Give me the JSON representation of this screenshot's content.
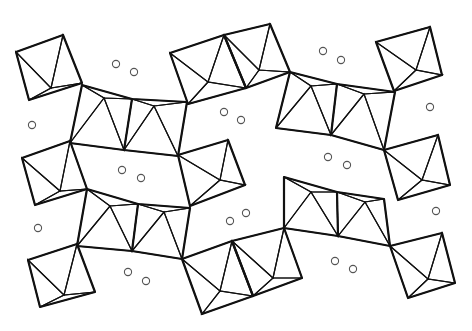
{
  "diagram": {
    "type": "crystal-structure-polyhedral",
    "colors": {
      "background": "#ffffff",
      "outline": "#111111",
      "hatch": "#222222",
      "atom_stroke": "#555555",
      "atom_fill": "#ffffff"
    },
    "hatch_spacing": 3.2,
    "isolated_octahedra": [
      {
        "id": "oct-tl",
        "quad": [
          [
            16,
            52
          ],
          [
            63,
            35
          ],
          [
            82,
            83
          ],
          [
            29,
            100
          ]
        ],
        "apex": [
          51,
          88
        ]
      },
      {
        "id": "oct-tc",
        "quad": [
          [
            170,
            53
          ],
          [
            224,
            35
          ],
          [
            246,
            88
          ],
          [
            188,
            104
          ]
        ],
        "apex": [
          208,
          82
        ]
      },
      {
        "id": "oct-tc2",
        "quad": [
          [
            224,
            35
          ],
          [
            270,
            24
          ],
          [
            290,
            72
          ],
          [
            246,
            88
          ]
        ],
        "apex": [
          259,
          70
        ]
      },
      {
        "id": "oct-tr",
        "quad": [
          [
            376,
            42
          ],
          [
            430,
            27
          ],
          [
            442,
            75
          ],
          [
            394,
            91
          ]
        ],
        "apex": [
          416,
          70
        ]
      },
      {
        "id": "oct-ml",
        "quad": [
          [
            22,
            158
          ],
          [
            70,
            141
          ],
          [
            87,
            189
          ],
          [
            35,
            205
          ]
        ],
        "apex": [
          60,
          191
        ]
      },
      {
        "id": "oct-mc",
        "quad": [
          [
            178,
            155
          ],
          [
            228,
            140
          ],
          [
            245,
            185
          ],
          [
            190,
            206
          ]
        ],
        "apex": [
          220,
          180
        ]
      },
      {
        "id": "oct-mr",
        "quad": [
          [
            384,
            150
          ],
          [
            438,
            135
          ],
          [
            450,
            185
          ],
          [
            398,
            200
          ]
        ],
        "apex": [
          422,
          180
        ]
      },
      {
        "id": "oct-bl",
        "quad": [
          [
            28,
            260
          ],
          [
            77,
            244
          ],
          [
            95,
            292
          ],
          [
            40,
            307
          ]
        ],
        "apex": [
          64,
          295
        ]
      },
      {
        "id": "oct-bc",
        "quad": [
          [
            182,
            259
          ],
          [
            232,
            241
          ],
          [
            253,
            296
          ],
          [
            202,
            314
          ]
        ],
        "apex": [
          220,
          291
        ]
      },
      {
        "id": "oct-bc2",
        "quad": [
          [
            232,
            241
          ],
          [
            284,
            228
          ],
          [
            302,
            278
          ],
          [
            253,
            296
          ]
        ],
        "apex": [
          273,
          278
        ]
      },
      {
        "id": "oct-br",
        "quad": [
          [
            390,
            246
          ],
          [
            442,
            233
          ],
          [
            455,
            283
          ],
          [
            408,
            298
          ]
        ],
        "apex": [
          428,
          279
        ]
      }
    ],
    "chains": [
      {
        "id": "chain-upper-left",
        "top": [
          [
            82,
            85
          ],
          [
            104,
            98
          ],
          [
            132,
            99
          ],
          [
            154,
            106
          ],
          [
            187,
            102
          ]
        ],
        "bottom": [
          [
            70,
            143
          ],
          [
            124,
            150
          ],
          [
            178,
            156
          ]
        ],
        "peaks": [
          [
            104,
            98
          ],
          [
            154,
            106
          ]
        ],
        "valleys": [
          [
            124,
            150
          ]
        ]
      },
      {
        "id": "chain-upper-right",
        "top": [
          [
            290,
            72
          ],
          [
            311,
            86
          ],
          [
            337,
            84
          ],
          [
            364,
            94
          ],
          [
            395,
            92
          ]
        ],
        "bottom": [
          [
            276,
            128
          ],
          [
            331,
            135
          ],
          [
            384,
            150
          ]
        ],
        "peaks": [
          [
            311,
            86
          ],
          [
            364,
            94
          ]
        ],
        "valleys": [
          [
            331,
            135
          ]
        ]
      },
      {
        "id": "chain-lower-left",
        "top": [
          [
            87,
            189
          ],
          [
            110,
            206
          ],
          [
            138,
            204
          ],
          [
            164,
            212
          ],
          [
            190,
            208
          ]
        ],
        "bottom": [
          [
            77,
            246
          ],
          [
            132,
            251
          ],
          [
            182,
            259
          ]
        ],
        "peaks": [
          [
            110,
            206
          ],
          [
            164,
            212
          ]
        ],
        "valleys": [
          [
            132,
            251
          ]
        ]
      },
      {
        "id": "chain-lower-right",
        "top": [
          [
            284,
            177
          ],
          [
            311,
            192
          ],
          [
            337,
            192
          ],
          [
            365,
            202
          ],
          [
            384,
            199
          ]
        ],
        "bottom": [
          [
            284,
            228
          ],
          [
            338,
            236
          ],
          [
            390,
            246
          ]
        ],
        "peaks": [
          [
            311,
            192
          ],
          [
            365,
            202
          ]
        ],
        "valleys": [
          [
            338,
            236
          ]
        ]
      }
    ],
    "atoms": [
      {
        "x": 116,
        "y": 64
      },
      {
        "x": 134,
        "y": 72
      },
      {
        "x": 224,
        "y": 112
      },
      {
        "x": 241,
        "y": 120
      },
      {
        "x": 323,
        "y": 51
      },
      {
        "x": 341,
        "y": 60
      },
      {
        "x": 32,
        "y": 125
      },
      {
        "x": 430,
        "y": 107
      },
      {
        "x": 122,
        "y": 170
      },
      {
        "x": 141,
        "y": 178
      },
      {
        "x": 328,
        "y": 157
      },
      {
        "x": 347,
        "y": 165
      },
      {
        "x": 38,
        "y": 228
      },
      {
        "x": 230,
        "y": 221
      },
      {
        "x": 246,
        "y": 213
      },
      {
        "x": 436,
        "y": 211
      },
      {
        "x": 128,
        "y": 272
      },
      {
        "x": 146,
        "y": 281
      },
      {
        "x": 335,
        "y": 261
      },
      {
        "x": 353,
        "y": 269
      }
    ],
    "atom_radius": 3.6
  }
}
